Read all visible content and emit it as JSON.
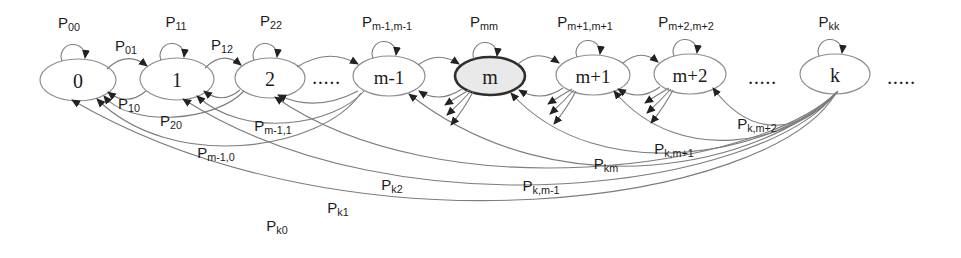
{
  "nodes": [
    {
      "label": "0"
    },
    {
      "label": "1"
    },
    {
      "label": "2"
    },
    {
      "label": "m-1"
    },
    {
      "label": "m",
      "highlighted": true
    },
    {
      "label": "m+1"
    },
    {
      "label": "m+2"
    },
    {
      "label": "k"
    }
  ],
  "ellipsis": {
    "left": ".....",
    "middle": ".....",
    "right": "....."
  },
  "labels": {
    "p00": {
      "base": "P",
      "sub": "00"
    },
    "p01": {
      "base": "P",
      "sub": "01"
    },
    "p11": {
      "base": "P",
      "sub": "11"
    },
    "p12": {
      "base": "P",
      "sub": "12"
    },
    "p22": {
      "base": "P",
      "sub": "22"
    },
    "pm1m1": {
      "base": "P",
      "sub": "m-1,m-1"
    },
    "pmm": {
      "base": "P",
      "sub": "mm"
    },
    "pp1": {
      "base": "P",
      "sub": "m+1,m+1"
    },
    "pp2": {
      "base": "P",
      "sub": "m+2,m+2"
    },
    "pkk": {
      "base": "P",
      "sub": "kk"
    },
    "p10": {
      "base": "P",
      "sub": "10"
    },
    "p20": {
      "base": "P",
      "sub": "20"
    },
    "pm11": {
      "base": "P",
      "sub": "m-1,1"
    },
    "pm10": {
      "base": "P",
      "sub": "m-1,0"
    },
    "pk2": {
      "base": "P",
      "sub": "k2"
    },
    "pk1": {
      "base": "P",
      "sub": "k1"
    },
    "pk0": {
      "base": "P",
      "sub": "k0"
    },
    "pkm2": {
      "base": "P",
      "sub": "k,m+2"
    },
    "pkm1": {
      "base": "P",
      "sub": "k,m+1"
    },
    "pkm": {
      "base": "P",
      "sub": "km"
    },
    "pkmm1": {
      "base": "P",
      "sub": "k,m-1"
    }
  },
  "colors": {
    "line": "#7d7d7d",
    "node_border": "#8f8f8f",
    "highlight_border": "#2e2e2e",
    "highlight_fill": "#e9e9e9",
    "text": "#1c1c1c"
  }
}
